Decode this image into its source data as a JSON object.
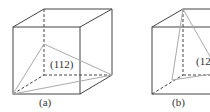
{
  "figures": [
    {
      "id": "a",
      "plane_label": "(112)",
      "caption": "(a)"
    },
    {
      "id": "b",
      "plane_label": "(123)",
      "caption": "(b)"
    }
  ],
  "colors": {
    "edge": "#444444",
    "plane": "#aaaaaa"
  }
}
